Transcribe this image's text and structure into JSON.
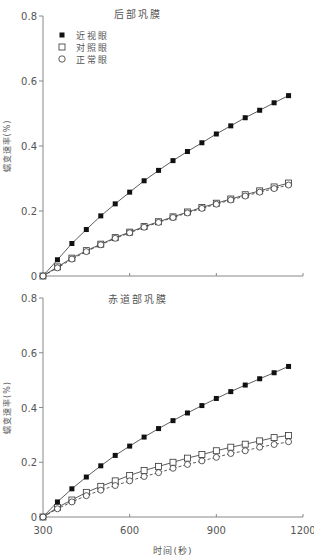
{
  "chart_data": [
    {
      "type": "line",
      "title": "后部巩膜",
      "xlabel": "",
      "ylabel": "蠕变速率(%)",
      "x": [
        300,
        350,
        400,
        450,
        500,
        550,
        600,
        650,
        700,
        750,
        800,
        850,
        900,
        950,
        1000,
        1050,
        1100,
        1150
      ],
      "xlim": [
        300,
        1200
      ],
      "ylim": [
        0,
        0.8
      ],
      "xticks": [
        300,
        600,
        900,
        1200
      ],
      "xtick_labels_visible": false,
      "yticks": [
        0,
        0.2,
        0.4,
        0.6,
        0.8
      ],
      "ytick_labels": [
        "0",
        "0.2",
        "0.4",
        "0.6",
        "0.8"
      ],
      "grid": false,
      "legend_position": "upper-left",
      "series": [
        {
          "name": "近视眼",
          "marker": "filled-square",
          "line": "solid",
          "values": [
            0,
            0.05,
            0.1,
            0.143,
            0.185,
            0.222,
            0.258,
            0.293,
            0.325,
            0.355,
            0.383,
            0.41,
            0.437,
            0.462,
            0.487,
            0.51,
            0.533,
            0.555
          ]
        },
        {
          "name": "对照眼",
          "marker": "open-square",
          "line": "solid",
          "values": [
            0,
            0.028,
            0.055,
            0.078,
            0.098,
            0.118,
            0.135,
            0.152,
            0.167,
            0.182,
            0.197,
            0.211,
            0.224,
            0.237,
            0.25,
            0.262,
            0.274,
            0.286
          ]
        },
        {
          "name": "正常眼",
          "marker": "open-circle",
          "line": "dashed",
          "values": [
            0,
            0.025,
            0.052,
            0.075,
            0.096,
            0.116,
            0.133,
            0.15,
            0.165,
            0.18,
            0.194,
            0.208,
            0.221,
            0.234,
            0.246,
            0.258,
            0.269,
            0.28
          ]
        }
      ]
    },
    {
      "type": "line",
      "title": "赤道部巩膜",
      "xlabel": "时间(秒)",
      "ylabel": "蠕变速率(%)",
      "x": [
        300,
        350,
        400,
        450,
        500,
        550,
        600,
        650,
        700,
        750,
        800,
        850,
        900,
        950,
        1000,
        1050,
        1100,
        1150
      ],
      "xlim": [
        300,
        1200
      ],
      "ylim": [
        0,
        0.8
      ],
      "xticks": [
        300,
        600,
        900,
        1200
      ],
      "xtick_labels": [
        "300",
        "600",
        "900",
        "1200"
      ],
      "yticks": [
        0,
        0.2,
        0.4,
        0.6,
        0.8
      ],
      "ytick_labels": [
        "0",
        "0.2",
        "0.4",
        "0.6",
        "0.8"
      ],
      "grid": false,
      "series": [
        {
          "name": "近视眼",
          "marker": "filled-square",
          "line": "solid",
          "values": [
            0,
            0.055,
            0.103,
            0.146,
            0.187,
            0.225,
            0.259,
            0.292,
            0.323,
            0.352,
            0.38,
            0.407,
            0.433,
            0.458,
            0.482,
            0.505,
            0.527,
            0.55
          ]
        },
        {
          "name": "对照眼",
          "marker": "open-square",
          "line": "solid",
          "values": [
            0,
            0.035,
            0.062,
            0.09,
            0.112,
            0.132,
            0.152,
            0.17,
            0.185,
            0.2,
            0.215,
            0.228,
            0.242,
            0.255,
            0.266,
            0.278,
            0.29,
            0.298
          ]
        },
        {
          "name": "正常眼",
          "marker": "open-circle",
          "line": "dashed",
          "values": [
            0,
            0.03,
            0.055,
            0.078,
            0.098,
            0.115,
            0.132,
            0.148,
            0.162,
            0.178,
            0.192,
            0.205,
            0.218,
            0.232,
            0.242,
            0.255,
            0.265,
            0.275
          ]
        }
      ]
    }
  ],
  "colors": {
    "axis": "#888888",
    "line": "#333333",
    "marker": "#111111",
    "text": "#555555"
  }
}
